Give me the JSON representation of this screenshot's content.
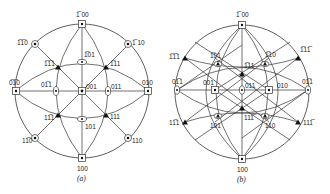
{
  "figure": {
    "panels": [
      {
        "id": "a",
        "caption": "(a)",
        "center": [
          82,
          91
        ],
        "radius": 67,
        "poles": [
          {
            "label": "1̅0 0",
            "text": "̅0",
            "display": "Ā0",
            "x": 82,
            "y": 24,
            "symbol": "square",
            "label_dx": -5,
            "label_dy": -6
          },
          {
            "label": "100",
            "display": "100",
            "x": 82,
            "y": 158,
            "symbol": "square",
            "label_dx": -5,
            "label_dy": 12
          },
          {
            "label": "0̅1 0",
            "display": "0̅1̅0",
            "x": 16,
            "y": 91,
            "symbol": "square",
            "label_dx": -7,
            "label_dy": -5
          },
          {
            "label": "010",
            "display": "010",
            "x": 148,
            "y": 91,
            "symbol": "square",
            "label_dx": -4,
            "label_dy": -5
          },
          {
            "label": "001",
            "display": "001",
            "x": 82,
            "y": 91,
            "symbol": "square",
            "label_dx": 4,
            "label_dy": -2
          },
          {
            "label": "-1-10",
            "display": "̅1̅1 0",
            "x": 35,
            "y": 44,
            "symbol": "diamond",
            "label_dx": -18,
            "label_dy": 1
          },
          {
            "label": "-110",
            "display": "̅1 10",
            "x": 128,
            "y": 44,
            "symbol": "diamond",
            "label_dx": 4,
            "label_dy": 1
          },
          {
            "label": "1-10",
            "display": "1̅1 0",
            "x": 35,
            "y": 138,
            "symbol": "diamond",
            "label_dx": -12,
            "label_dy": 5
          },
          {
            "label": "110",
            "display": "110",
            "x": 128,
            "y": 138,
            "symbol": "diamond",
            "label_dx": 4,
            "label_dy": 5
          },
          {
            "label": "-101",
            "display": "̅101",
            "x": 82,
            "y": 62,
            "symbol": "ellipse",
            "label_dx": 2,
            "label_dy": -5
          },
          {
            "label": "101",
            "display": "101",
            "x": 82,
            "y": 119,
            "symbol": "ellipse",
            "label_dx": 3,
            "label_dy": 10
          },
          {
            "label": "0-11",
            "display": "0̅11",
            "x": 56,
            "y": 91,
            "symbol": "ellipse",
            "label_dx": -14,
            "label_dy": -4
          },
          {
            "label": "011",
            "display": "011",
            "x": 108,
            "y": 91,
            "symbol": "ellipse",
            "label_dx": 3,
            "label_dy": -2
          },
          {
            "label": "-1-11",
            "display": "̅1̅11",
            "x": 58,
            "y": 67,
            "symbol": "triangle",
            "label_dx": -14,
            "label_dy": -1
          },
          {
            "label": "-111",
            "display": "̅111",
            "x": 106,
            "y": 67,
            "symbol": "triangle",
            "label_dx": 4,
            "label_dy": -1
          },
          {
            "label": "1-11",
            "display": "1̅11",
            "x": 58,
            "y": 115,
            "symbol": "triangle",
            "label_dx": -14,
            "label_dy": 5
          },
          {
            "label": "111",
            "display": "111",
            "x": 106,
            "y": 115,
            "symbol": "triangle",
            "label_dx": 4,
            "label_dy": 4
          }
        ]
      },
      {
        "id": "b",
        "caption": "(b)",
        "center": [
          242,
          92
        ],
        "radius": 67,
        "poles": [
          {
            "label": "-100",
            "display": "̅100",
            "x": 242,
            "y": 25,
            "symbol": "square",
            "label_dx": -5,
            "label_dy": -6
          },
          {
            "label": "100",
            "display": "100",
            "x": 242,
            "y": 159,
            "symbol": "square",
            "label_dx": -5,
            "label_dy": 12
          },
          {
            "label": "0-11 (left rim)",
            "display": "0̅11",
            "x": 177,
            "y": 90,
            "symbol": "ellipse",
            "label_dx": -6,
            "label_dy": -6
          },
          {
            "label": "01-1",
            "display": "01̅1",
            "x": 308,
            "y": 90,
            "symbol": "ellipse",
            "label_dx": -6,
            "label_dy": -6
          },
          {
            "label": "001",
            "display": "001",
            "x": 215,
            "y": 90,
            "symbol": "square",
            "label_dx": -12,
            "label_dy": -5
          },
          {
            "label": "011",
            "display": "011",
            "x": 242,
            "y": 90,
            "symbol": "ellipse",
            "label_dx": 3,
            "label_dy": -3
          },
          {
            "label": "010",
            "display": "010",
            "x": 269,
            "y": 90,
            "symbol": "square",
            "label_dx": 6,
            "label_dy": -3
          },
          {
            "label": "-1-11",
            "display": "̅1̅1 1",
            "x": 185,
            "y": 58,
            "symbol": "triangle",
            "label_dx": -16,
            "label_dy": -1
          },
          {
            "label": "-101",
            "display": "̅101",
            "x": 218,
            "y": 64,
            "symbol": "triangle",
            "label_dx": -6,
            "label_dy": -6
          },
          {
            "label": "-111",
            "display": "̅111",
            "x": 242,
            "y": 74,
            "symbol": "triangle",
            "label_dx": 2,
            "label_dy": -5
          },
          {
            "label": "-110",
            "display": "̅110",
            "x": 265,
            "y": 64,
            "symbol": "triangle",
            "label_dx": 1,
            "label_dy": -6
          },
          {
            "label": "-11-1",
            "display": "̅11̅1",
            "x": 298,
            "y": 58,
            "symbol": "triangle",
            "label_dx": 2,
            "label_dy": -5
          },
          {
            "label": "1-11",
            "display": "1̅11",
            "x": 185,
            "y": 122,
            "symbol": "triangle",
            "label_dx": -16,
            "label_dy": 3
          },
          {
            "label": "101",
            "display": "101",
            "x": 218,
            "y": 116,
            "symbol": "triangle",
            "label_dx": -6,
            "label_dy": 10
          },
          {
            "label": "11-1 (center)",
            "display": "11̅1",
            "x": 242,
            "y": 108,
            "symbol": "triangle",
            "label_dx": 2,
            "label_dy": 8
          },
          {
            "label": "110",
            "display": "110",
            "x": 265,
            "y": 116,
            "symbol": "triangle",
            "label_dx": 1,
            "label_dy": 10
          },
          {
            "label": "11-1 (right)",
            "display": "11̅1",
            "x": 298,
            "y": 122,
            "symbol": "triangle",
            "label_dx": 4,
            "label_dy": 3
          }
        ]
      }
    ]
  },
  "labels": {
    "a": {
      "top": "1̅ 00",
      "bottom": "100",
      "left": "0̅1̅0",
      "right": "010",
      "center": "001",
      "ul": "1̅1̅0",
      "ur": "1̅ 10",
      "ll": "11̅0",
      "lr": "110",
      "upper_mid": "1̅01",
      "lower_mid": "101",
      "left_mid": "01̅1",
      "right_mid": "011",
      "tri_ul": "1̅1̅1",
      "tri_ur": "1̅11",
      "tri_ll": "11̅1",
      "tri_lr": "111",
      "caption": "(a)"
    },
    "b": {
      "top": "1̅ 00",
      "bottom": "100",
      "left": "01̅1",
      "right": "01̅1",
      "c1": "001",
      "c2": "011",
      "c3": "010",
      "ul": "1̅1̅1",
      "u1": "1̅01",
      "u2": "1̅11",
      "u3": "1̅10",
      "ur": "1̅11̅",
      "ll": "11̅1",
      "l1": "101",
      "l2": "111̅",
      "l3": "110",
      "lr": "111̅",
      "caption": "(b)"
    }
  }
}
